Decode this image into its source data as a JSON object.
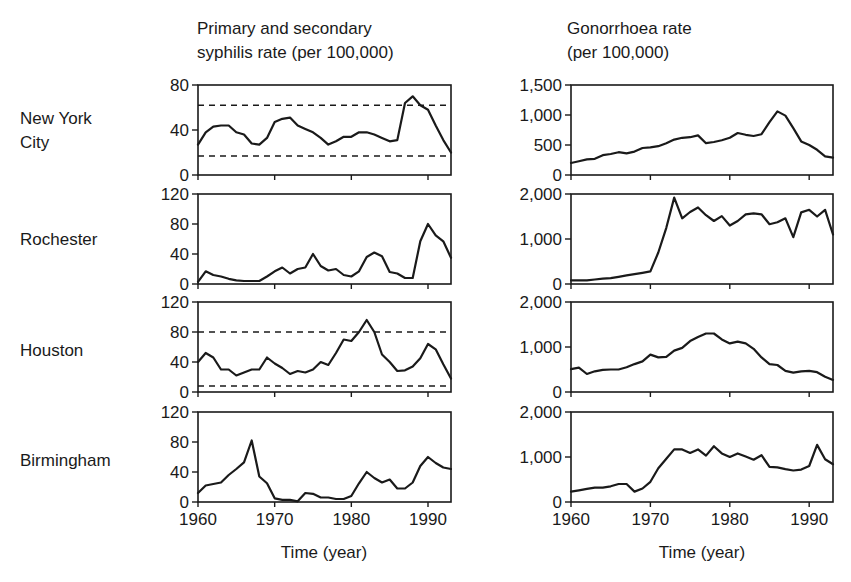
{
  "chart_data": {
    "type": "line",
    "layout": "small-multiples grid, 4 rows (cities) x 2 columns (diseases)",
    "grid": false,
    "xlabel": "Time (year)",
    "x_ticks": [
      1960,
      1970,
      1980,
      1990
    ],
    "xlim": [
      1960,
      1993
    ],
    "x": [
      1960,
      1961,
      1962,
      1963,
      1964,
      1965,
      1966,
      1967,
      1968,
      1969,
      1970,
      1971,
      1972,
      1973,
      1974,
      1975,
      1976,
      1977,
      1978,
      1979,
      1980,
      1981,
      1982,
      1983,
      1984,
      1985,
      1986,
      1987,
      1988,
      1989,
      1990,
      1991,
      1992,
      1993
    ],
    "columns": [
      {
        "key": "syphilis",
        "title_lines": [
          "Primary and secondary",
          "syphilis rate (per 100,000)"
        ]
      },
      {
        "key": "gonorrhoea",
        "title_lines": [
          "Gonorrhoea rate",
          "(per 100,000)"
        ]
      }
    ],
    "rows": [
      {
        "label_lines": [
          "New York",
          "City"
        ],
        "syphilis": {
          "ylim": [
            0,
            80
          ],
          "y_ticks": [
            0,
            40,
            80
          ],
          "y_tick_labels": [
            "0",
            "40",
            "80"
          ],
          "reference_lines": [
            62,
            17
          ],
          "values": [
            27,
            38,
            43,
            44,
            44,
            38,
            36,
            28,
            27,
            33,
            47,
            50,
            51,
            44,
            41,
            38,
            33,
            27,
            30,
            34,
            34,
            38,
            38,
            36,
            33,
            30,
            31,
            64,
            70,
            62,
            58,
            44,
            31,
            20
          ]
        },
        "gonorrhoea": {
          "ylim": [
            0,
            1500
          ],
          "y_ticks": [
            0,
            500,
            1000,
            1500
          ],
          "y_tick_labels": [
            "0",
            "500",
            "1,000",
            "1,500"
          ],
          "values": [
            200,
            230,
            260,
            270,
            330,
            350,
            380,
            360,
            390,
            450,
            460,
            480,
            530,
            590,
            620,
            630,
            660,
            530,
            550,
            580,
            620,
            700,
            670,
            650,
            680,
            880,
            1060,
            990,
            780,
            560,
            500,
            420,
            310,
            290
          ]
        }
      },
      {
        "label_lines": [
          "Rochester"
        ],
        "syphilis": {
          "ylim": [
            0,
            120
          ],
          "y_ticks": [
            0,
            40,
            80,
            120
          ],
          "y_tick_labels": [
            "0",
            "40",
            "80",
            "120"
          ],
          "reference_lines": [],
          "values": [
            3,
            17,
            12,
            10,
            7,
            5,
            4,
            4,
            4,
            10,
            17,
            22,
            14,
            20,
            22,
            40,
            24,
            18,
            20,
            12,
            10,
            17,
            36,
            42,
            37,
            16,
            14,
            8,
            8,
            57,
            80,
            65,
            57,
            35,
            28
          ]
        },
        "gonorrhoea": {
          "ylim": [
            0,
            2000
          ],
          "y_ticks": [
            0,
            1000,
            2000
          ],
          "y_tick_labels": [
            "0",
            "1,000",
            "2,000"
          ],
          "values": [
            80,
            80,
            80,
            100,
            120,
            130,
            160,
            190,
            220,
            250,
            280,
            700,
            1250,
            1920,
            1460,
            1600,
            1700,
            1530,
            1400,
            1510,
            1300,
            1400,
            1550,
            1570,
            1550,
            1330,
            1370,
            1460,
            1040,
            1590,
            1650,
            1500,
            1650,
            1100
          ]
        }
      },
      {
        "label_lines": [
          "Houston"
        ],
        "syphilis": {
          "ylim": [
            0,
            120
          ],
          "y_ticks": [
            0,
            40,
            80,
            120
          ],
          "y_tick_labels": [
            "0",
            "40",
            "80",
            "120"
          ],
          "reference_lines": [
            80,
            8
          ],
          "values": [
            40,
            52,
            46,
            30,
            30,
            22,
            26,
            30,
            30,
            46,
            38,
            32,
            24,
            28,
            26,
            30,
            40,
            36,
            52,
            70,
            68,
            80,
            96,
            80,
            50,
            40,
            28,
            29,
            34,
            45,
            64,
            57,
            37,
            18
          ]
        },
        "gonorrhoea": {
          "ylim": [
            0,
            2000
          ],
          "y_ticks": [
            0,
            1000,
            2000
          ],
          "y_tick_labels": [
            "0",
            "1,000",
            "2,000"
          ],
          "values": [
            510,
            540,
            400,
            460,
            490,
            500,
            500,
            550,
            620,
            680,
            830,
            770,
            780,
            920,
            980,
            1130,
            1220,
            1300,
            1300,
            1170,
            1080,
            1120,
            1080,
            960,
            770,
            620,
            600,
            470,
            430,
            460,
            470,
            440,
            340,
            270
          ]
        }
      },
      {
        "label_lines": [
          "Birmingham"
        ],
        "syphilis": {
          "ylim": [
            0,
            120
          ],
          "y_ticks": [
            0,
            40,
            80,
            120
          ],
          "y_tick_labels": [
            "0",
            "40",
            "80",
            "120"
          ],
          "reference_lines": [],
          "values": [
            12,
            22,
            24,
            26,
            36,
            44,
            53,
            82,
            34,
            25,
            5,
            3,
            3,
            1,
            12,
            11,
            6,
            6,
            4,
            4,
            8,
            25,
            40,
            32,
            26,
            30,
            18,
            18,
            26,
            48,
            60,
            52,
            46,
            44
          ]
        },
        "gonorrhoea": {
          "ylim": [
            0,
            2000
          ],
          "y_ticks": [
            0,
            1000,
            2000
          ],
          "y_tick_labels": [
            "0",
            "1,000",
            "2,000"
          ],
          "values": [
            230,
            260,
            290,
            320,
            320,
            350,
            400,
            400,
            230,
            300,
            450,
            750,
            960,
            1170,
            1170,
            1090,
            1170,
            1030,
            1240,
            1080,
            1000,
            1080,
            1010,
            940,
            1040,
            780,
            770,
            730,
            700,
            720,
            800,
            1270,
            950,
            840
          ]
        }
      }
    ]
  },
  "labels": {
    "col1_title_line1": "Primary and secondary",
    "col1_title_line2": "syphilis rate (per 100,000)",
    "col2_title_line1": "Gonorrhoea rate",
    "col2_title_line2": "(per 100,000)",
    "row1_line1": "New York",
    "row1_line2": "City",
    "row2": "Rochester",
    "row3": "Houston",
    "row4": "Birmingham",
    "xlabel_left": "Time (year)",
    "xlabel_right": "Time (year)"
  },
  "colors": {
    "line": "#1a1a1a",
    "background": "#ffffff"
  }
}
